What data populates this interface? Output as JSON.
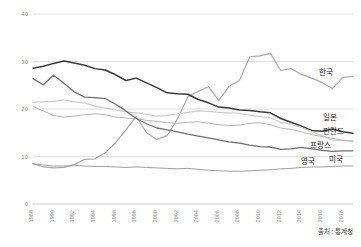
{
  "chart_data": {
    "type": "line",
    "title": "",
    "xlabel": "",
    "ylabel": "",
    "ylim": [
      0,
      40
    ],
    "xlim": [
      1988,
      2019
    ],
    "yticks": [
      0,
      10,
      20,
      30,
      40
    ],
    "grid": true,
    "legend_position": "right-inline-labels",
    "source_note": "출처 : 통계청",
    "categories": [
      "1988",
      "1989",
      "1990",
      "1991",
      "1992",
      "1993",
      "1994",
      "1995",
      "1996",
      "1997",
      "1998",
      "1999",
      "2000",
      "2001",
      "2002",
      "2003",
      "2004",
      "2005",
      "2006",
      "2007",
      "2008",
      "2009",
      "2010",
      "2011",
      "2012",
      "2013",
      "2014",
      "2015",
      "2016",
      "2017",
      "2018",
      "2019"
    ],
    "xticklabels": [
      "1988",
      "1990",
      "1992",
      "1994",
      "1996",
      "1998",
      "2000",
      "2002",
      "2004",
      "2006",
      "2008",
      "2010",
      "2012",
      "2014",
      "2016",
      "2018"
    ],
    "series": [
      {
        "name": "한국",
        "name_en": "Korea",
        "color": "#a9a9a9",
        "width": 1.2,
        "values": [
          8.5,
          7.8,
          7.6,
          7.7,
          8.3,
          9.4,
          9.5,
          10.8,
          12.9,
          15.6,
          18.4,
          15.0,
          13.6,
          14.4,
          17.9,
          22.6,
          23.7,
          24.7,
          21.8,
          24.8,
          26.0,
          31.0,
          31.2,
          31.7,
          28.1,
          28.5,
          27.3,
          26.5,
          25.6,
          24.3,
          26.6,
          26.9
        ]
      },
      {
        "name": "일본",
        "name_en": "Japan",
        "color": "#3a3a3a",
        "width": 1.5,
        "values": [
          28.6,
          29.0,
          29.6,
          30.1,
          29.7,
          29.2,
          28.5,
          28.2,
          27.2,
          26.0,
          26.5,
          25.5,
          24.5,
          23.4,
          23.2,
          23.1,
          22.0,
          21.3,
          20.4,
          20.2,
          19.8,
          19.7,
          19.4,
          19.2,
          18.0,
          17.2,
          16.4,
          15.5,
          15.3,
          15.8,
          15.2,
          14.9
        ]
      },
      {
        "name": "핀란드",
        "name_en": "Finland",
        "color": "#cccccc",
        "width": 1.2,
        "values": [
          21.4,
          21.5,
          21.6,
          21.9,
          21.5,
          21.3,
          20.6,
          20.2,
          19.8,
          19.4,
          19.2,
          18.9,
          18.5,
          18.6,
          19.0,
          19.3,
          19.6,
          19.5,
          19.3,
          19.2,
          19.1,
          18.7,
          18.4,
          18.1,
          17.2,
          16.8,
          16.1,
          15.2,
          14.4,
          13.5,
          13.4,
          13.3
        ]
      },
      {
        "name": "프랑스",
        "name_en": "France",
        "color": "#b5b5b5",
        "width": 1.0,
        "values": [
          20.5,
          19.6,
          18.6,
          18.3,
          18.5,
          18.8,
          19.0,
          18.8,
          18.3,
          18.1,
          18.0,
          17.6,
          17.4,
          17.1,
          17.0,
          17.2,
          17.3,
          17.0,
          16.7,
          16.5,
          16.6,
          17.0,
          17.1,
          16.7,
          16.0,
          15.7,
          15.2,
          14.6,
          14.2,
          13.8,
          13.4,
          13.2
        ]
      },
      {
        "name": "미국",
        "name_en": "USA",
        "color": "#6e6e6e",
        "width": 1.3,
        "values": [
          26.4,
          25.1,
          27.1,
          25.4,
          23.6,
          22.5,
          22.4,
          22.2,
          21.0,
          19.6,
          18.0,
          16.9,
          16.0,
          15.6,
          15.2,
          14.7,
          14.3,
          13.9,
          13.5,
          13.1,
          12.8,
          12.4,
          12.1,
          12.0,
          11.5,
          11.6,
          11.9,
          11.6,
          11.3,
          11.1,
          11.2,
          11.2
        ]
      },
      {
        "name": "영국",
        "name_en": "UK",
        "color": "#9e9e9e",
        "width": 1.0,
        "values": [
          8.5,
          8.2,
          8.0,
          8.0,
          8.1,
          8.0,
          7.9,
          7.9,
          7.8,
          7.7,
          7.8,
          7.7,
          7.6,
          7.5,
          7.4,
          7.5,
          7.3,
          7.1,
          7.0,
          6.9,
          6.9,
          7.0,
          7.1,
          7.2,
          7.4,
          7.5,
          7.7,
          7.8,
          7.8,
          7.9,
          8.0,
          8.0
        ]
      }
    ],
    "series_labels": [
      {
        "name": "한국",
        "x": 326,
        "y": 75
      },
      {
        "name": "일본",
        "x": 330,
        "y": 120
      },
      {
        "name": "핀란드",
        "x": 333,
        "y": 134
      },
      {
        "name": "프랑스",
        "x": 320,
        "y": 148
      },
      {
        "name": "영국",
        "x": 308,
        "y": 164
      },
      {
        "name": "미국",
        "x": 336,
        "y": 162
      }
    ]
  },
  "footer": {
    "source": "출처 : 통계청"
  }
}
